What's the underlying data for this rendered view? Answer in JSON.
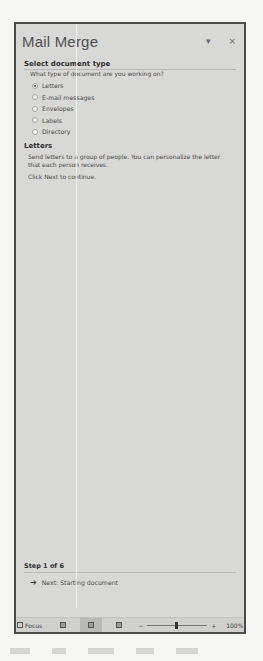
{
  "pane": {
    "title": "Mail Merge",
    "dropdown_icon": "chevron-down-icon",
    "close_icon": "close-icon",
    "close_glyph": "×",
    "dropdown_glyph": "▾"
  },
  "select_document_type": {
    "heading": "Select document type",
    "question": "What type of document are you working on?",
    "options": [
      {
        "label": "Letters",
        "checked": true
      },
      {
        "label": "E-mail messages",
        "checked": false
      },
      {
        "label": "Envelopes",
        "checked": false
      },
      {
        "label": "Labels",
        "checked": false
      },
      {
        "label": "Directory",
        "checked": false
      }
    ]
  },
  "letters": {
    "heading": "Letters",
    "description": "Send letters to a group of people. You can personalize the letter that each person receives.",
    "instruction": "Click Next to continue."
  },
  "step": {
    "label": "Step 1 of 6",
    "next_link": "Next: Starting document",
    "arrow_glyph": "➔"
  },
  "status_bar": {
    "focus_label": "Focus",
    "zoom_minus": "−",
    "zoom_plus": "+",
    "zoom_level": "100%"
  }
}
